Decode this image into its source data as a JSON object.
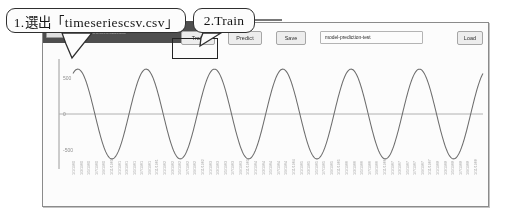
{
  "annotations": [
    {
      "id": "select-file",
      "label": "1.選出「timeseriescsv.csv」"
    },
    {
      "id": "train",
      "label": "2.Train"
    }
  ],
  "toolbar": {
    "upload": {
      "choose_file_label": "Choose File",
      "filename": "timeseriescsv.csv",
      "hint": "1.csv data file"
    },
    "train_label": "Train",
    "predict_label": "Predict",
    "save_label": "Save",
    "load_label": "Load",
    "model_name_value": "model-prediction-test",
    "model_name_placeholder": "model name"
  },
  "chart_data": {
    "type": "line",
    "title": "",
    "xlabel": "",
    "ylabel": "",
    "ylim": [
      -760,
      760
    ],
    "yticks": [
      500,
      0,
      -500
    ],
    "ytick_labels": [
      "500",
      "0",
      "-500"
    ],
    "grid": false,
    "legend": null,
    "series": [
      {
        "name": "timeseries",
        "color": "#6b6b6b",
        "description": "sinusoidal wave, amplitude ~620, about 6 full cycles across the axis",
        "amplitude": 620,
        "cycles": 6,
        "phase_start": 0.18
      },
      {
        "name": "zero-baseline",
        "color": "#b0b0b0",
        "description": "horizontal reference line at y = 0",
        "values": [
          0,
          0
        ]
      }
    ],
    "xtick_labels": [
      "1/1/1960",
      "1/3/1960",
      "1/5/1960",
      "1/7/1960",
      "1/9/1960",
      "1/11/1960",
      "1/1/1961",
      "1/3/1961",
      "1/5/1961",
      "1/7/1961",
      "1/9/1961",
      "1/11/1961",
      "1/1/1962",
      "1/3/1962",
      "1/5/1962",
      "1/7/1962",
      "1/9/1962",
      "1/11/1962",
      "1/1/1963",
      "1/3/1963",
      "1/5/1963",
      "1/7/1963",
      "1/9/1963",
      "1/11/1963",
      "1/1/1964",
      "1/3/1964",
      "1/5/1964",
      "1/7/1964",
      "1/9/1964",
      "1/11/1964",
      "1/1/1965",
      "1/3/1965",
      "1/5/1965",
      "1/7/1965",
      "1/9/1965",
      "1/11/1965",
      "1/1/1966",
      "1/3/1966",
      "1/5/1966",
      "1/7/1966",
      "1/9/1966",
      "1/11/1966",
      "1/1/1967",
      "1/3/1967",
      "1/5/1967",
      "1/7/1967",
      "1/9/1967",
      "1/11/1967",
      "1/1/1968",
      "1/3/1968",
      "1/5/1968",
      "1/7/1968",
      "1/9/1968",
      "1/11/1968"
    ]
  },
  "colors": {
    "line": "#6b6b6b",
    "baseline": "#b0b0b0",
    "axis": "#9a9a9a",
    "annotation_border": "#2b2b2b",
    "upload_bg": "#4b4b4b"
  }
}
